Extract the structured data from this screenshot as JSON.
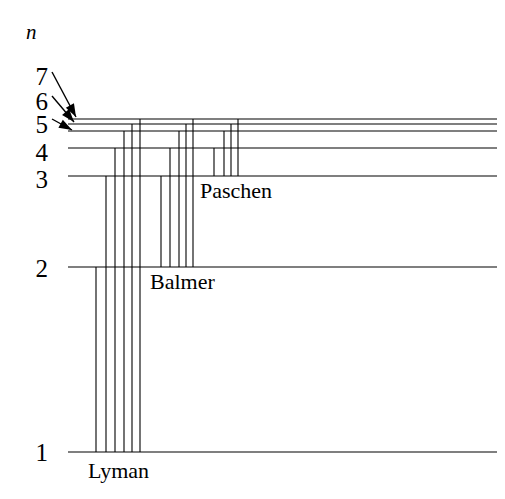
{
  "figure": {
    "axis_label": "n",
    "background_color": "#ffffff",
    "line_color": "#000000",
    "width": 505,
    "height": 499
  },
  "level_labels": [
    {
      "name": "level-label-7",
      "text": "7",
      "x": 26,
      "y": 64
    },
    {
      "name": "level-label-6",
      "text": "6",
      "x": 26,
      "y": 89
    },
    {
      "name": "level-label-5",
      "text": "5",
      "x": 26,
      "y": 112
    },
    {
      "name": "level-label-4",
      "text": "4",
      "x": 26,
      "y": 140
    },
    {
      "name": "level-label-3",
      "text": "3",
      "x": 26,
      "y": 167
    },
    {
      "name": "level-label-2",
      "text": "2",
      "x": 26,
      "y": 256
    },
    {
      "name": "level-label-1",
      "text": "1",
      "x": 26,
      "y": 440
    }
  ],
  "series_labels": [
    {
      "name": "series-label-lyman",
      "text": "Lyman",
      "x": 88,
      "y": 460
    },
    {
      "name": "series-label-balmer",
      "text": "Balmer",
      "x": 150,
      "y": 271
    },
    {
      "name": "series-label-paschen",
      "text": "Paschen",
      "x": 200,
      "y": 180
    }
  ],
  "chart_data": {
    "type": "diagram",
    "ylabel": "n",
    "x_start": 68,
    "x_end": 497,
    "levels": [
      {
        "n": 1,
        "y": 452,
        "x_start": 68,
        "x_end": 497
      },
      {
        "n": 2,
        "y": 267,
        "x_start": 68,
        "x_end": 497
      },
      {
        "n": 3,
        "y": 176,
        "x_start": 68,
        "x_end": 497
      },
      {
        "n": 4,
        "y": 148,
        "x_start": 68,
        "x_end": 497
      },
      {
        "n": 5,
        "y": 131,
        "x_start": 68,
        "x_end": 497
      },
      {
        "n": 6,
        "y": 124,
        "x_start": 68,
        "x_end": 497
      },
      {
        "n": 7,
        "y": 119,
        "x_start": 68,
        "x_end": 497
      }
    ],
    "pointer_arrows": [
      {
        "from_x": 52,
        "from_y": 72,
        "to_x": 76,
        "to_y": 117,
        "target_n": 7
      },
      {
        "from_x": 52,
        "from_y": 96,
        "to_x": 74,
        "to_y": 122,
        "target_n": 6
      },
      {
        "from_x": 52,
        "from_y": 119,
        "to_x": 72,
        "to_y": 130,
        "target_n": 5
      }
    ],
    "series": [
      {
        "name": "Lyman",
        "lower_level": 1,
        "lower_y": 452,
        "transitions": [
          {
            "from_n": 2,
            "from_y": 267,
            "x": 96
          },
          {
            "from_n": 3,
            "from_y": 176,
            "x": 106
          },
          {
            "from_n": 4,
            "from_y": 148,
            "x": 115
          },
          {
            "from_n": 5,
            "from_y": 131,
            "x": 124
          },
          {
            "from_n": 6,
            "from_y": 124,
            "x": 132
          },
          {
            "from_n": 7,
            "from_y": 119,
            "x": 140
          }
        ]
      },
      {
        "name": "Balmer",
        "lower_level": 2,
        "lower_y": 267,
        "transitions": [
          {
            "from_n": 3,
            "from_y": 176,
            "x": 161
          },
          {
            "from_n": 4,
            "from_y": 148,
            "x": 170
          },
          {
            "from_n": 5,
            "from_y": 131,
            "x": 179
          },
          {
            "from_n": 6,
            "from_y": 124,
            "x": 186
          },
          {
            "from_n": 7,
            "from_y": 119,
            "x": 193
          }
        ]
      },
      {
        "name": "Paschen",
        "lower_level": 3,
        "lower_y": 176,
        "transitions": [
          {
            "from_n": 4,
            "from_y": 148,
            "x": 214
          },
          {
            "from_n": 5,
            "from_y": 131,
            "x": 224
          },
          {
            "from_n": 6,
            "from_y": 124,
            "x": 231
          },
          {
            "from_n": 7,
            "from_y": 119,
            "x": 238
          }
        ]
      }
    ]
  }
}
